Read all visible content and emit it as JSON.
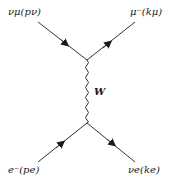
{
  "diagram": {
    "type": "feynman",
    "title": "",
    "colors": {
      "line": "#333333",
      "text": "#1a1a1a",
      "background": "#ffffff"
    },
    "particles": {
      "top_left": "νμ(pν)",
      "top_right": "μ⁻(kμ)",
      "bottom_left": "e⁻(pe)",
      "bottom_right": "νe(ke)"
    },
    "boson": "W",
    "vertices": [
      {
        "id": "top",
        "x": 87,
        "y": 60
      },
      {
        "id": "bottom",
        "x": 87,
        "y": 123
      }
    ],
    "edges": [
      {
        "from": "nu_mu",
        "to": "top",
        "kind": "fermion",
        "arrow": "incoming"
      },
      {
        "from": "top",
        "to": "mu",
        "kind": "fermion",
        "arrow": "outgoing"
      },
      {
        "from": "e",
        "to": "bottom",
        "kind": "fermion",
        "arrow": "incoming"
      },
      {
        "from": "bottom",
        "to": "nu_e",
        "kind": "fermion",
        "arrow": "outgoing"
      },
      {
        "from": "top",
        "to": "bottom",
        "kind": "boson-wavy",
        "label": "W"
      }
    ]
  }
}
